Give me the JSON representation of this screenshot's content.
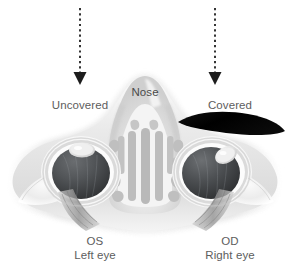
{
  "figure": {
    "background_color": "#ffffff",
    "width": 290,
    "height": 275,
    "illustration_type": "axial cross-section of human head showing both orbits"
  },
  "annotations": {
    "left_arrow": {
      "name": "dashed-down-arrow-left",
      "color": "#2b2b2b",
      "style": "dotted-vertical-with-solid-arrowhead",
      "x": 80,
      "y_start": 8,
      "y_end": 82
    },
    "right_arrow": {
      "name": "dashed-down-arrow-right",
      "color": "#2b2b2b",
      "style": "dotted-vertical-with-solid-arrowhead",
      "x": 215,
      "y_start": 8,
      "y_end": 82
    },
    "occluder": {
      "name": "black-occluder-paddle",
      "color": "#000000",
      "shape": "lens-crescent tilted down to the right",
      "covers": "right eye (OD)"
    }
  },
  "labels": {
    "uncovered": "Uncovered",
    "covered": "Covered",
    "nose": "Nose",
    "left_eye_code": "OS",
    "left_eye_name": "Left eye",
    "right_eye_code": "OD",
    "right_eye_name": "Right eye"
  },
  "colors": {
    "text": "#5d5d5d",
    "nose_text": "#4a4a4a",
    "arrow": "#2b2b2b",
    "occluder": "#000000",
    "tissue_light": "#f2f2f2",
    "tissue_mid": "#d8d8d8",
    "tissue_dark": "#b4b4b4",
    "cavity_gray": "#bdbdbd",
    "globe_dark": "#4f5153",
    "globe_darker": "#3a3c3e",
    "cornea_light": "#e8e8e8",
    "sclera_rim": "#fbfbfb",
    "muscle_gray": "#8f8f8f"
  },
  "anatomy": {
    "left_orbit": {
      "name": "left-eye-globe",
      "cornea_position": "superior-center",
      "alignment": "aligned / fixating"
    },
    "right_orbit": {
      "name": "right-eye-globe",
      "cornea_position": "superior-lateral",
      "alignment": "deviated under cover"
    },
    "nasal_cavity": {
      "name": "nasal-cavity-turbinates",
      "structures": "vertical turbinate columns with lateral ethmoid air cells"
    }
  }
}
